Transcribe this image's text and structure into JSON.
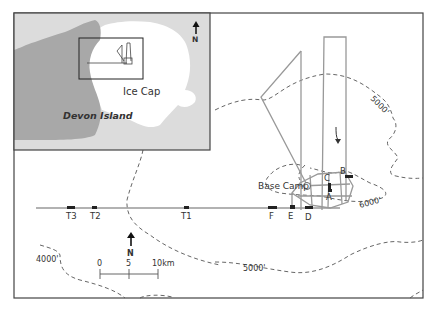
{
  "inset": {
    "north_label": "N",
    "ice_cap_label": "Ice Cap",
    "island_label": "Devon Island"
  },
  "main": {
    "north_label": "N",
    "base_camp_label": "Base Camp",
    "contours": [
      "5000'",
      "6000'",
      "4000'",
      "5000'"
    ],
    "sites": {
      "A": "A",
      "B": "B",
      "C": "C",
      "D": "D",
      "E": "E",
      "F": "F",
      "T1": "T1",
      "T2": "T2",
      "T3": "T3"
    },
    "scale": {
      "zero": "0",
      "mid": "5",
      "end": "10km"
    }
  },
  "colors": {
    "sea": "#dcdcdc",
    "land": "#a8a8a8",
    "ice": "#ffffff",
    "frame": "#444444",
    "route": "#999999",
    "contour": "#555555"
  }
}
